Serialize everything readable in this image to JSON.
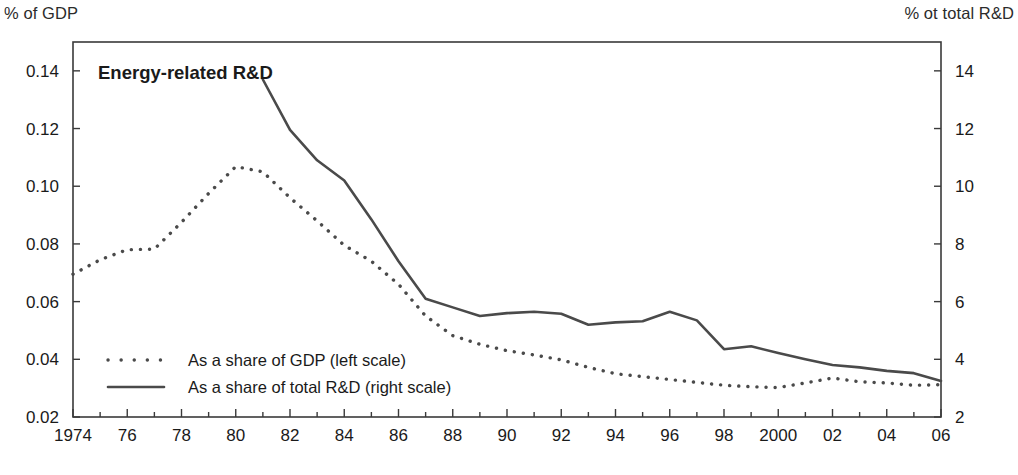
{
  "figure": {
    "left_axis_caption": "% of GDP",
    "right_axis_caption": "% ot total R&D",
    "title": "Energy-related R&D"
  },
  "legend": {
    "items": [
      {
        "label": "As a share of GDP (left scale)",
        "style": "dotted",
        "color": "#4a4a4a"
      },
      {
        "label": "As a share of total R&D (right scale)",
        "style": "solid",
        "color": "#4a4a4a"
      }
    ]
  },
  "chart_data": {
    "type": "line",
    "title": "Energy-related R&D",
    "xlabel": "",
    "ylabel": "% of GDP",
    "y2label": "% ot total R&D",
    "grid": false,
    "legend_position": "bottom-left",
    "x": [
      1974,
      1975,
      1976,
      1977,
      1978,
      1979,
      1980,
      1981,
      1982,
      1983,
      1984,
      1985,
      1986,
      1987,
      1988,
      1989,
      1990,
      1991,
      1992,
      1993,
      1994,
      1995,
      1996,
      1997,
      1998,
      1999,
      2000,
      2001,
      2002,
      2003,
      2004,
      2005,
      2006
    ],
    "xtick_values": [
      1974,
      1976,
      1978,
      1980,
      1982,
      1984,
      1986,
      1988,
      1990,
      1992,
      1994,
      1996,
      1998,
      2000,
      2002,
      2004,
      2006
    ],
    "xtick_labels": [
      "1974",
      "76",
      "78",
      "80",
      "82",
      "84",
      "86",
      "88",
      "90",
      "92",
      "94",
      "96",
      "98",
      "2000",
      "02",
      "04",
      "06"
    ],
    "xlim": [
      1974,
      2006
    ],
    "ylim": [
      0.02,
      0.15
    ],
    "ytick_values": [
      0.02,
      0.04,
      0.06,
      0.08,
      0.1,
      0.12,
      0.14
    ],
    "ytick_labels": [
      "0.02",
      "0.04",
      "0.06",
      "0.08",
      "0.10",
      "0.12",
      "0.14"
    ],
    "y2lim": [
      2,
      15
    ],
    "y2tick_values": [
      2,
      4,
      6,
      8,
      10,
      12,
      14
    ],
    "y2tick_labels": [
      "2",
      "4",
      "6",
      "8",
      "10",
      "12",
      "14"
    ],
    "series": [
      {
        "name": "As a share of GDP (left scale)",
        "axis": "left",
        "style": "dotted",
        "color": "#4a4a4a",
        "x": [
          1974,
          1975,
          1976,
          1977,
          1978,
          1979,
          1980,
          1981,
          1982,
          1983,
          1984,
          1985,
          1986,
          1987,
          1988,
          1989,
          1990,
          1991,
          1992,
          1993,
          1994,
          1995,
          1996,
          1997,
          1998,
          1999,
          2000,
          2001,
          2002,
          2003,
          2004,
          2005,
          2006
        ],
        "values": [
          0.0695,
          0.0745,
          0.078,
          0.0782,
          0.0875,
          0.0975,
          0.1068,
          0.105,
          0.096,
          0.088,
          0.0795,
          0.074,
          0.066,
          0.055,
          0.0482,
          0.0452,
          0.043,
          0.0415,
          0.0398,
          0.0372,
          0.035,
          0.034,
          0.033,
          0.032,
          0.031,
          0.0305,
          0.0302,
          0.0318,
          0.0335,
          0.0322,
          0.0318,
          0.031,
          0.0312
        ]
      },
      {
        "name": "As a share of total R&D (right scale)",
        "axis": "right",
        "style": "solid",
        "color": "#4a4a4a",
        "x": [
          1981,
          1982,
          1983,
          1984,
          1985,
          1986,
          1987,
          1988,
          1989,
          1990,
          1991,
          1992,
          1993,
          1994,
          1995,
          1996,
          1997,
          1998,
          1999,
          2000,
          2001,
          2002,
          2003,
          2004,
          2005,
          2006
        ],
        "values": [
          13.7,
          11.95,
          10.9,
          10.2,
          8.85,
          7.4,
          6.1,
          5.8,
          5.5,
          5.6,
          5.65,
          5.58,
          5.2,
          5.28,
          5.32,
          5.65,
          5.35,
          4.35,
          4.45,
          4.22,
          4.0,
          3.8,
          3.72,
          3.6,
          3.52,
          3.25
        ]
      }
    ]
  },
  "plot_geometry": {
    "left": 73,
    "right": 941,
    "top": 42,
    "bottom": 417
  }
}
